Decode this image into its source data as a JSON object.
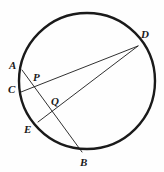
{
  "figure": {
    "background_color": "#fefefe",
    "stroke_color": "#1a1a1a",
    "circle_stroke_width": 2.4,
    "chord_stroke_width": 0.9
  },
  "chart_data": {
    "type": "diagram",
    "xlabel": "",
    "ylabel": "",
    "circle": {
      "center_x": 87,
      "center_y": 81,
      "radius": 68,
      "label": "circle"
    },
    "points": [
      {
        "id": "A",
        "label": "A",
        "x": 22,
        "y": 70,
        "on_circle": true,
        "label_x": 9,
        "label_y": 60
      },
      {
        "id": "C",
        "label": "C",
        "x": 21,
        "y": 92,
        "on_circle": true,
        "label_x": 8,
        "label_y": 84
      },
      {
        "id": "E",
        "label": "E",
        "x": 38,
        "y": 122,
        "on_circle": true,
        "label_x": 24,
        "label_y": 124
      },
      {
        "id": "B",
        "label": "B",
        "x": 82,
        "y": 152,
        "on_circle": true,
        "label_x": 80,
        "label_y": 157
      },
      {
        "id": "D",
        "label": "D",
        "x": 138,
        "y": 46,
        "on_circle": true,
        "label_x": 141,
        "label_y": 29
      },
      {
        "id": "P",
        "label": "P",
        "x": 32,
        "y": 84,
        "on_circle": false,
        "label_x": 33,
        "label_y": 72
      },
      {
        "id": "Q",
        "label": "Q",
        "x": 58,
        "y": 108,
        "on_circle": false,
        "label_x": 51,
        "label_y": 96
      }
    ],
    "segments": [
      {
        "id": "AB",
        "label": "A-B",
        "from": "A",
        "to": "B",
        "x1": 22,
        "y1": 70,
        "x2": 82,
        "y2": 152
      },
      {
        "id": "CD",
        "label": "C-D",
        "from": "C",
        "to": "D",
        "x1": 21,
        "y1": 92,
        "x2": 138,
        "y2": 46
      },
      {
        "id": "ED",
        "label": "E-D",
        "from": "E",
        "to": "D",
        "x1": 38,
        "y1": 122,
        "x2": 138,
        "y2": 46
      }
    ],
    "intersections": [
      {
        "id": "P",
        "label": "P",
        "of": [
          "AB",
          "CD"
        ],
        "x": 32,
        "y": 84
      },
      {
        "id": "Q",
        "label": "Q",
        "of": [
          "AB",
          "ED"
        ],
        "x": 58,
        "y": 108
      }
    ]
  }
}
